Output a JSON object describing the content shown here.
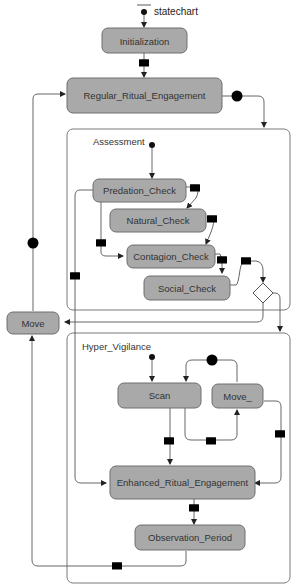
{
  "diagram": {
    "title": "statechart",
    "colors": {
      "state_fill": "#a9a9a9",
      "state_stroke": "#6e6e6e",
      "edge": "#555555",
      "background": "#ffffff"
    },
    "states": {
      "initialization": "Initialization",
      "regular_ritual_engagement": "Regular_Ritual_Engagement",
      "predation_check": "Predation_Check",
      "natural_check": "Natural_Check",
      "contagion_check": "Contagion_Check",
      "social_check": "Social_Check",
      "move": "Move",
      "scan": "Scan",
      "move_": "Move_",
      "enhanced_ritual_engagement": "Enhanced_Ritual_Engagement",
      "observation_period": "Observation_Period"
    },
    "composites": {
      "assessment": "Assessment",
      "hyper_vigilance": "Hyper_Vigilance"
    },
    "transition_icons": {
      "message": "envelope-icon",
      "timeout": "clock-icon"
    }
  }
}
